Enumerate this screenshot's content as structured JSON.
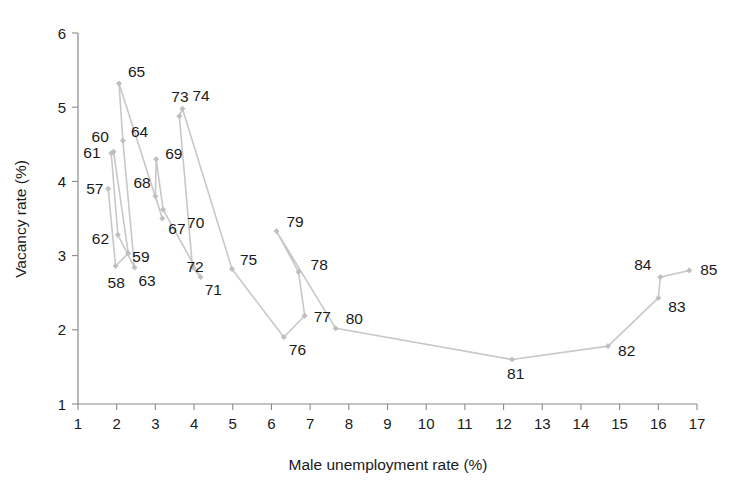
{
  "chart_data": {
    "type": "line",
    "title": "",
    "subtitle": "",
    "xlabel": "Male unemployment rate (%)",
    "ylabel": "Vacancy rate (%)",
    "xlim": [
      1,
      17
    ],
    "ylim": [
      1,
      6
    ],
    "xticks": [
      "1",
      "2",
      "3",
      "4",
      "5",
      "6",
      "7",
      "8",
      "9",
      "10",
      "11",
      "12",
      "13",
      "14",
      "15",
      "16",
      "17"
    ],
    "yticks": [
      "1",
      "2",
      "3",
      "4",
      "5",
      "6"
    ],
    "grid": false,
    "legend": "none",
    "marker": "diamond",
    "line_color": "#c8c8c8",
    "marker_color": "#c0c0c0",
    "series": [
      {
        "name": "UK Beveridge curve 1957-1985",
        "points": [
          {
            "label": "57",
            "x": 1.78,
            "y": 3.9,
            "label_dx": -22,
            "label_dy": 5
          },
          {
            "label": "58",
            "x": 1.97,
            "y": 2.86,
            "label_dx": -8,
            "label_dy": 22
          },
          {
            "label": "59",
            "x": 2.3,
            "y": 3.03,
            "label_dx": 4,
            "label_dy": 9
          },
          {
            "label": "60",
            "x": 1.92,
            "y": 4.4,
            "label_dx": -22,
            "label_dy": -10
          },
          {
            "label": "61",
            "x": 1.86,
            "y": 4.38,
            "label_dx": -28,
            "label_dy": 5
          },
          {
            "label": "62",
            "x": 2.03,
            "y": 3.28,
            "label_dx": -26,
            "label_dy": 9
          },
          {
            "label": "63",
            "x": 2.46,
            "y": 2.84,
            "label_dx": 4,
            "label_dy": 19
          },
          {
            "label": "64",
            "x": 2.16,
            "y": 4.55,
            "label_dx": 8,
            "label_dy": -4
          },
          {
            "label": "65",
            "x": 2.06,
            "y": 5.32,
            "label_dx": 9,
            "label_dy": -6
          },
          {
            "label": "67",
            "x": 3.18,
            "y": 3.5,
            "label_dx": 6,
            "label_dy": 15
          },
          {
            "label": "68",
            "x": 3.0,
            "y": 3.8,
            "label_dx": -22,
            "label_dy": -8
          },
          {
            "label": "69",
            "x": 3.02,
            "y": 4.3,
            "label_dx": 9,
            "label_dy": 0
          },
          {
            "label": "70",
            "x": 3.2,
            "y": 3.62,
            "label_dx": 24,
            "label_dy": 18
          },
          {
            "label": "71",
            "x": 4.17,
            "y": 2.71,
            "label_dx": 4,
            "label_dy": 18
          },
          {
            "label": "72",
            "x": 3.96,
            "y": 2.84,
            "label_dx": -6,
            "label_dy": 5
          },
          {
            "label": "73",
            "x": 3.62,
            "y": 4.88,
            "label_dx": -8,
            "label_dy": -14
          },
          {
            "label": "74",
            "x": 3.7,
            "y": 4.98,
            "label_dx": 10,
            "label_dy": -8
          },
          {
            "label": "75",
            "x": 4.98,
            "y": 2.82,
            "label_dx": 8,
            "label_dy": -4
          },
          {
            "label": "76",
            "x": 6.32,
            "y": 1.9,
            "label_dx": 5,
            "label_dy": 18
          },
          {
            "label": "77",
            "x": 6.86,
            "y": 2.19,
            "label_dx": 9,
            "label_dy": 6
          },
          {
            "label": "78",
            "x": 6.7,
            "y": 2.78,
            "label_dx": 12,
            "label_dy": -2
          },
          {
            "label": "79",
            "x": 6.13,
            "y": 3.33,
            "label_dx": 10,
            "label_dy": -4
          },
          {
            "label": "80",
            "x": 7.66,
            "y": 2.02,
            "label_dx": 10,
            "label_dy": -4
          },
          {
            "label": "81",
            "x": 12.22,
            "y": 1.6,
            "label_dx": -5,
            "label_dy": 20
          },
          {
            "label": "82",
            "x": 14.7,
            "y": 1.78,
            "label_dx": 10,
            "label_dy": 10
          },
          {
            "label": "83",
            "x": 16.0,
            "y": 2.43,
            "label_dx": 10,
            "label_dy": 14
          },
          {
            "label": "84",
            "x": 16.05,
            "y": 2.71,
            "label_dx": -26,
            "label_dy": -7
          },
          {
            "label": "85",
            "x": 16.8,
            "y": 2.8,
            "label_dx": 11,
            "label_dy": 5
          }
        ]
      }
    ],
    "connection_order": [
      "57",
      "58",
      "59",
      "60",
      "61",
      "62",
      "63",
      "64",
      "65",
      "67",
      "68",
      "69",
      "70",
      "71",
      "72",
      "73",
      "74",
      "75",
      "76",
      "77",
      "78",
      "79",
      "80",
      "81",
      "82",
      "83",
      "84",
      "85"
    ]
  },
  "geometry": {
    "plot_left": 78,
    "plot_right": 697,
    "plot_top": 33,
    "plot_bottom": 404
  }
}
